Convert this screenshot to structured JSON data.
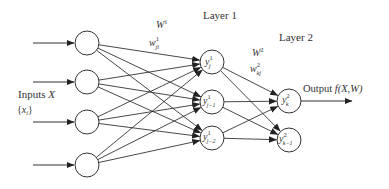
{
  "diagram": {
    "type": "feedforward-neural-network",
    "layers": {
      "input": {
        "label": "Inputs X",
        "sublabel": "{x_i}",
        "label_main": "Inputs ",
        "label_var": "X",
        "sublabel_open": "{",
        "sublabel_var": "x",
        "sublabel_sub": "i",
        "sublabel_close": "}",
        "nodes": [
          {
            "id": "x1",
            "cx": 87,
            "cy": 43
          },
          {
            "id": "x2",
            "cx": 87,
            "cy": 82
          },
          {
            "id": "x3",
            "cx": 87,
            "cy": 122
          },
          {
            "id": "x4",
            "cx": 87,
            "cy": 165
          }
        ]
      },
      "hidden": {
        "title": "Layer 1",
        "weight_matrix_label": "W^1",
        "weight_matrix_base": "W",
        "weight_matrix_sup": "1",
        "weight_label": "w^1_ji",
        "weight_base": "w",
        "weight_sup": "1",
        "weight_sub": "ji",
        "nodes": [
          {
            "id": "h1",
            "cx": 212,
            "cy": 62,
            "base": "y",
            "sup": "1",
            "sub": "j"
          },
          {
            "id": "h2",
            "cx": 212,
            "cy": 102,
            "base": "y",
            "sup": "1",
            "sub": "j−1"
          },
          {
            "id": "h3",
            "cx": 212,
            "cy": 138,
            "base": "y",
            "sup": "1",
            "sub": "j−2"
          }
        ]
      },
      "output": {
        "title": "Layer 2",
        "weight_matrix_label": "W^2",
        "weight_matrix_base": "W",
        "weight_matrix_sup": "2",
        "weight_label": "w^2_kj",
        "weight_base": "w",
        "weight_sup": "2",
        "weight_sub": "kj",
        "output_label": "Output f(X,W)",
        "output_text": "Output ",
        "output_func": "f(X,W)",
        "nodes": [
          {
            "id": "o1",
            "cx": 289,
            "cy": 101,
            "base": "y",
            "sup": "2",
            "sub": "k"
          },
          {
            "id": "o2",
            "cx": 289,
            "cy": 140,
            "base": "y",
            "sup": "2",
            "sub": "k−1"
          }
        ]
      }
    },
    "node_radius": 12,
    "connectivity": "fully-connected",
    "colors": {
      "stroke": "#333333",
      "background": "#ffffff"
    }
  }
}
